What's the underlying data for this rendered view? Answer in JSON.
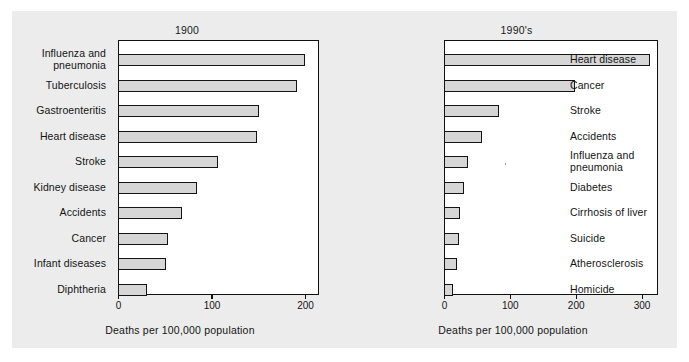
{
  "figure": {
    "background_color": "#ececec",
    "bar_fill_color": "#d6d6d6",
    "bar_edge_color": "#141414"
  },
  "chart_data": [
    {
      "type": "bar",
      "orientation": "horizontal",
      "title": "1900",
      "xlabel": "Deaths per 100,000 population",
      "ylabel": "",
      "xlim": [
        0,
        215
      ],
      "xticks": [
        0,
        100,
        200
      ],
      "xticklabels": [
        "0",
        "100",
        "200"
      ],
      "grid": false,
      "legend": false,
      "categories": [
        "Influenza and\npneumonia",
        "Tuberculosis",
        "Gastroenteritis",
        "Heart disease",
        "Stroke",
        "Kidney disease",
        "Accidents",
        "Cancer",
        "Infant diseases",
        "Diphtheria"
      ],
      "values": [
        198,
        189,
        149,
        147,
        105,
        82,
        66,
        51,
        49,
        29
      ]
    },
    {
      "type": "bar",
      "orientation": "horizontal",
      "title": "1990's",
      "xlabel": "Deaths per 100,000 population",
      "ylabel": "",
      "xlim": [
        0,
        325
      ],
      "xticks": [
        0,
        100,
        200,
        300
      ],
      "xticklabels": [
        "0",
        "100",
        "200",
        "300"
      ],
      "grid": false,
      "legend": false,
      "categories": [
        "Heart disease",
        "Cancer",
        "Stroke",
        "Accidents",
        "Influenza and\npneumonia",
        "Diabetes",
        "Cirrhosis of liver",
        "Suicide",
        "Atherosclerosis",
        "Homicide"
      ],
      "values": [
        310,
        196,
        80,
        55,
        33,
        27,
        21,
        19,
        17,
        10
      ]
    }
  ],
  "panels": [
    {
      "id": "1900",
      "title": "1900",
      "axis_title": "Deaths per 100,000 population",
      "ticks": [
        "0",
        "100",
        "200"
      ],
      "rows": [
        {
          "label_line1": "Influenza and",
          "label_line2": "pneumonia",
          "value": 198
        },
        {
          "label_line1": "Tuberculosis",
          "label_line2": "",
          "value": 189
        },
        {
          "label_line1": "Gastroenteritis",
          "label_line2": "",
          "value": 149
        },
        {
          "label_line1": "Heart disease",
          "label_line2": "",
          "value": 147
        },
        {
          "label_line1": "Stroke",
          "label_line2": "",
          "value": 105
        },
        {
          "label_line1": "Kidney disease",
          "label_line2": "",
          "value": 82
        },
        {
          "label_line1": "Accidents",
          "label_line2": "",
          "value": 66
        },
        {
          "label_line1": "Cancer",
          "label_line2": "",
          "value": 51
        },
        {
          "label_line1": "Infant diseases",
          "label_line2": "",
          "value": 49
        },
        {
          "label_line1": "Diphtheria",
          "label_line2": "",
          "value": 29
        }
      ]
    },
    {
      "id": "1990",
      "title": "1990's",
      "axis_title": "Deaths per 100,000 population",
      "ticks": [
        "0",
        "100",
        "200",
        "300"
      ],
      "rows": [
        {
          "label_line1": "Heart disease",
          "label_line2": "",
          "value": 310
        },
        {
          "label_line1": "Cancer",
          "label_line2": "",
          "value": 196
        },
        {
          "label_line1": "Stroke",
          "label_line2": "",
          "value": 80
        },
        {
          "label_line1": "Accidents",
          "label_line2": "",
          "value": 55
        },
        {
          "label_line1": "Influenza and",
          "label_line2": "pneumonia",
          "value": 33
        },
        {
          "label_line1": "Diabetes",
          "label_line2": "",
          "value": 27
        },
        {
          "label_line1": "Cirrhosis of liver",
          "label_line2": "",
          "value": 21
        },
        {
          "label_line1": "Suicide",
          "label_line2": "",
          "value": 19
        },
        {
          "label_line1": "Atherosclerosis",
          "label_line2": "",
          "value": 17
        },
        {
          "label_line1": "Homicide",
          "label_line2": "",
          "value": 10
        }
      ]
    }
  ]
}
